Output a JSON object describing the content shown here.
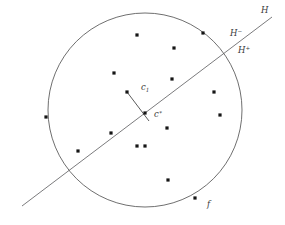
{
  "figure": {
    "background_color": "#ffffff",
    "stroke_color": "#4a4a4a",
    "point_color": "#151515",
    "canvas": {
      "width": 285,
      "height": 225
    },
    "circle": {
      "cx": 145,
      "cy": 110,
      "r": 97,
      "label": ""
    },
    "hyperplane": {
      "x1": 22,
      "y1": 206,
      "x2": 272,
      "y2": 17
    },
    "segments": [
      {
        "name": "c1-to-cstar",
        "x1": 127,
        "y1": 92,
        "x2": 149,
        "y2": 121
      }
    ],
    "labels": [
      {
        "id": "H",
        "text": "H",
        "sup": "",
        "sub": "",
        "x": 261,
        "y": 13
      },
      {
        "id": "Hminus",
        "text": "H",
        "sup": "−",
        "sub": "",
        "x": 230,
        "y": 36
      },
      {
        "id": "Hplus",
        "text": "H",
        "sup": "+",
        "sub": "",
        "x": 238,
        "y": 53
      },
      {
        "id": "c1",
        "text": "c",
        "sup": "",
        "sub": "1",
        "x": 141,
        "y": 90
      },
      {
        "id": "cstar",
        "text": "c",
        "sup": "∗",
        "sub": "",
        "x": 154,
        "y": 117
      },
      {
        "id": "f",
        "text": "f",
        "sup": "",
        "sub": "",
        "x": 207,
        "y": 207
      }
    ],
    "points": [
      {
        "id": "p1",
        "x": 137,
        "y": 35,
        "on_circle": false
      },
      {
        "id": "p2",
        "x": 174,
        "y": 48,
        "on_circle": false
      },
      {
        "id": "p3",
        "x": 203,
        "y": 33,
        "on_circle": true
      },
      {
        "id": "p4",
        "x": 114,
        "y": 73,
        "on_circle": false
      },
      {
        "id": "p5",
        "x": 172,
        "y": 79,
        "on_circle": false
      },
      {
        "id": "p6",
        "x": 214,
        "y": 92,
        "on_circle": false
      },
      {
        "id": "p7",
        "x": 127,
        "y": 92,
        "on_circle": false
      },
      {
        "id": "p8",
        "x": 220,
        "y": 115,
        "on_circle": false
      },
      {
        "id": "p9",
        "x": 46,
        "y": 117,
        "on_circle": true
      },
      {
        "id": "p10",
        "x": 145,
        "y": 113,
        "on_circle": false
      },
      {
        "id": "p11",
        "x": 167,
        "y": 128,
        "on_circle": false
      },
      {
        "id": "p12",
        "x": 111,
        "y": 133,
        "on_circle": false
      },
      {
        "id": "p13",
        "x": 78,
        "y": 151,
        "on_circle": false
      },
      {
        "id": "p14",
        "x": 137,
        "y": 146,
        "on_circle": false
      },
      {
        "id": "p15",
        "x": 145,
        "y": 146,
        "on_circle": false
      },
      {
        "id": "p16",
        "x": 168,
        "y": 180,
        "on_circle": false
      },
      {
        "id": "p17",
        "x": 195,
        "y": 198,
        "on_circle": true
      }
    ]
  }
}
